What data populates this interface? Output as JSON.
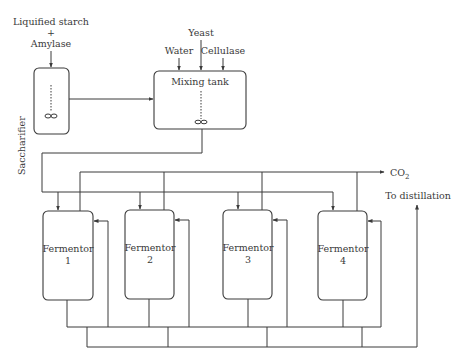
{
  "diagram": {
    "title": "",
    "colors": {
      "stroke": "#3a3a3a",
      "background": "#ffffff"
    },
    "inputs": {
      "saccharifier_feed_line1": "Liquified starch",
      "saccharifier_feed_plus": "+",
      "saccharifier_feed_line2": "Amylase",
      "yeast": "Yeast",
      "water": "Water",
      "cellulase": "Cellulase"
    },
    "units": {
      "saccharifier": "Saccharifier",
      "mixing_tank": "Mixing tank",
      "fermentors": [
        {
          "name": "Fermentor",
          "number": "1"
        },
        {
          "name": "Fermentor",
          "number": "2"
        },
        {
          "name": "Fermentor",
          "number": "3"
        },
        {
          "name": "Fermentor",
          "number": "4"
        }
      ]
    },
    "outputs": {
      "co2_main": "CO",
      "co2_sub": "2",
      "distillation": "To distillation"
    }
  }
}
